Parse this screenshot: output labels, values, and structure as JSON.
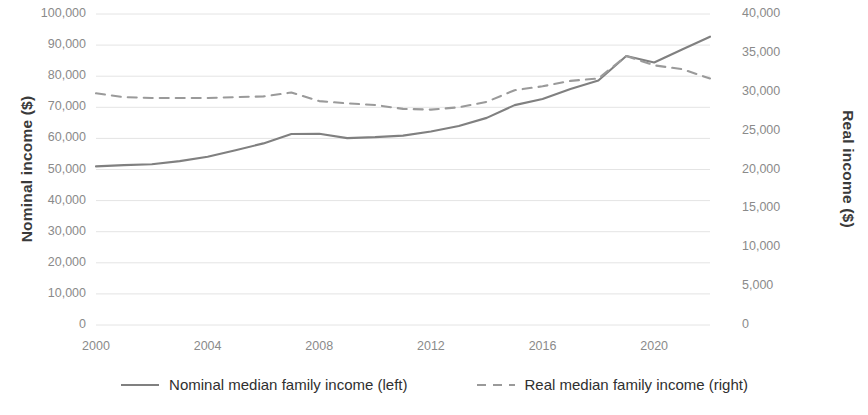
{
  "chart_data": {
    "type": "line",
    "title": "",
    "xlabel": "",
    "ylabel": "Nominal income ($)",
    "y2label": "Real income ($)",
    "x": [
      2000,
      2001,
      2002,
      2003,
      2004,
      2005,
      2006,
      2007,
      2008,
      2009,
      2010,
      2011,
      2012,
      2013,
      2014,
      2015,
      2016,
      2017,
      2018,
      2019,
      2020,
      2021,
      2022
    ],
    "xlim": [
      2000,
      2022
    ],
    "ylim": [
      0,
      100000
    ],
    "y2lim": [
      0,
      40000
    ],
    "xticks": [
      2000,
      2004,
      2008,
      2012,
      2016,
      2020
    ],
    "xticklabels": [
      "2000",
      "2004",
      "2008",
      "2012",
      "2016",
      "2020"
    ],
    "yticks": [
      0,
      10000,
      20000,
      30000,
      40000,
      50000,
      60000,
      70000,
      80000,
      90000,
      100000
    ],
    "yticklabels": [
      "0",
      "10,000",
      "20,000",
      "30,000",
      "40,000",
      "50,000",
      "60,000",
      "70,000",
      "80,000",
      "90,000",
      "100,000"
    ],
    "y2ticks": [
      0,
      5000,
      10000,
      15000,
      20000,
      25000,
      30000,
      35000,
      40000
    ],
    "y2ticklabels": [
      "0",
      "5,000",
      "10,000",
      "15,000",
      "20,000",
      "25,000",
      "30,000",
      "35,000",
      "40,000"
    ],
    "grid": true,
    "grid_axis": "y",
    "legend_position": "bottom",
    "series": [
      {
        "name": "Nominal median family income (left)",
        "axis": "left",
        "style": "solid",
        "color": "#808080",
        "values": [
          51000,
          51400,
          51700,
          52700,
          54100,
          56200,
          58400,
          61400,
          61500,
          60100,
          60400,
          60900,
          62200,
          64000,
          66600,
          70700,
          72700,
          75900,
          78600,
          86500,
          84400,
          88600,
          92700
        ]
      },
      {
        "name": "Real median family income (right)",
        "axis": "right",
        "style": "dashed",
        "color": "#9a9a9a",
        "values": [
          29800,
          29300,
          29200,
          29200,
          29200,
          29300,
          29400,
          29900,
          28800,
          28500,
          28300,
          27800,
          27700,
          28000,
          28700,
          30200,
          30700,
          31400,
          31700,
          34600,
          33400,
          32900,
          31700
        ]
      }
    ]
  },
  "legend": {
    "entries": [
      {
        "label": "Nominal median family income (left)",
        "style": "solid"
      },
      {
        "label": "Real median family income (right)",
        "style": "dashed"
      }
    ]
  },
  "axes": {
    "left_title": "Nominal income ($)",
    "right_title": "Real income ($)"
  },
  "colors": {
    "nominal_line": "#808080",
    "real_line": "#9a9a9a",
    "gridline": "#e4e4e4",
    "tick_text": "#8a8a8a",
    "axis_title_text": "#3a3a3a"
  }
}
